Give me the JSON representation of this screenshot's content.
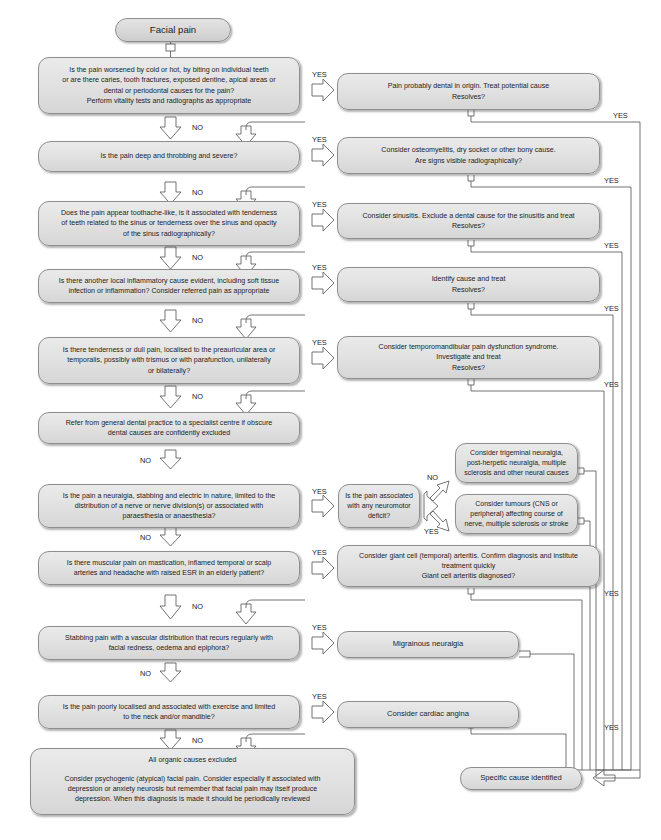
{
  "labels": {
    "yes": "YES",
    "no": "NO"
  },
  "nodes": {
    "start": "Facial pain",
    "q1": "Is the pain worsened by cold or hot, by biting on individual teeth\nor are there caries, tooth fractures, exposed dentine, apical areas or\ndental or periodontal causes for the pain?\nPerform vitality tests and radiographs as appropriate",
    "a1": "Pain probably dental in origin. Treat potential cause\nResolves?",
    "q2": "Is the pain deep and throbbing and severe?",
    "a2": "Consider osteomyelitis, dry socket or other bony cause.\nAre signs visible radiographically?",
    "q3": "Does the pain appear toothache-like, is it associated with tenderness\nof teeth related to the sinus or tenderness over the sinus and opacity\nof the sinus radiographically?",
    "a3": "Consider sinusitis. Exclude a dental cause for the sinusitis and treat\nResolves?",
    "q4": "Is there another local inflammatory cause evident, including soft tissue\ninfection or inflammation? Consider referred pain as appropriate",
    "a4": "Identify cause and treat\nResolves?",
    "q5": "Is there tenderness or dull pain, localised to the preauricular area or\ntemporalis, possibly with trismus or with parafunction, unilaterally\nor bilaterally?",
    "a5": "Consider temporomandibular pain dysfunction syndrome.\nInvestigate and treat\nResolves?",
    "refer": "Refer from general dental practice to a specialist centre if obscure\ndental causes are confidently excluded",
    "q6": "Is the pain a neuralgia, stabbing and electric in nature, limited to the\ndistribution of a nerve or nerve division(s) or associated with\nparaesthesia or anaesthesia?",
    "q6b": "Is the pain associated\nwith any neuromotor\ndeficit?",
    "a6no": "Consider trigeminal neuralgia,\npost-herpetic neuralgia, multiple\nsclerosis and other neural causes",
    "a6yes": "Consider tumours (CNS or\nperipheral) affecting course of\nnerve, multiple sclerosis or stroke",
    "q7": "Is there muscular pain on mastication, inflamed temporal or scalp\narteries and headache with raised ESR in an elderly patient?",
    "a7": "Consider giant cell (temporal) arteritis. Confirm diagnosis and institute\ntreatment quickly\nGiant cell arteritis diagnosed?",
    "q8": "Stabbing pain with a vascular distribution that recurs regularly with\nfacial redness, oedema and epiphora?",
    "a8": "Migrainous neuralgia",
    "q9": "Is the pain poorly localised and associated with exercise and limited\nto the neck and/or mandible?",
    "a9": "Consider cardiac angina",
    "final_head": "All organic causes excluded",
    "final_body": "Consider psychogenic (atypical) facial pain. Consider especially if associated with\ndepression or anxiety neurosis but remember that facial pain may itself produce\ndepression. When this diagnosis is made it should be periodically reviewed",
    "specific": "Specific cause identified"
  },
  "yes_labels": {
    "row1": "YES",
    "row2": "YES",
    "row3": "YES",
    "row4": "YES",
    "row5": "YES",
    "row6": "YES",
    "row7": "YES",
    "row8": "YES",
    "row9": "YES",
    "right1": "YES",
    "right2": "YES",
    "right3": "YES",
    "right4": "YES",
    "right5": "YES",
    "right6": "YES",
    "right7": "YES",
    "branch_yes": "YES"
  },
  "no_labels": {
    "row1": "NO",
    "row2": "NO",
    "row3": "NO",
    "row4": "NO",
    "row5": "NO",
    "row6": "NO",
    "row7": "NO",
    "row8": "NO",
    "row9": "NO",
    "branch_no": "NO"
  },
  "colors": {
    "node_fill": "#e2e2e2",
    "node_border": "#8e8e8e",
    "wire": "#5b5b5b",
    "text": "#1d1d1d",
    "background": "#ffffff"
  }
}
